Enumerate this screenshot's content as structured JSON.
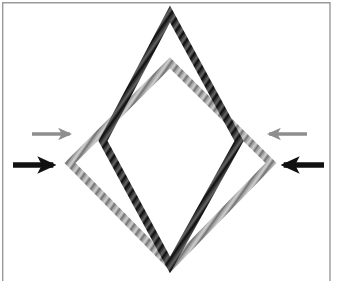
{
  "figure": {
    "background_color": "#ffffff",
    "frame": {
      "name": "panel-border",
      "color": "#9a9a9a",
      "stroke_width": 1.4,
      "x": 2,
      "y": 2,
      "width": 328,
      "height": 279,
      "open_bottom": true
    },
    "shapes": [
      {
        "id": "dark-diamond",
        "label": "undeformed-diamond",
        "color": "#3a3a3a",
        "stroke_width": 8,
        "texture": "braided-rope-hatch",
        "vertices": {
          "top": {
            "x": 170,
            "y": 14
          },
          "left": {
            "x": 103,
            "y": 141
          },
          "bottom": {
            "x": 170,
            "y": 265
          },
          "right": {
            "x": 239,
            "y": 141
          }
        },
        "width": 136,
        "height": 251
      },
      {
        "id": "gray-diamond",
        "label": "deformed-diamond",
        "color": "#a8a8a8",
        "stroke_width": 8,
        "texture": "braided-rope-hatch",
        "vertices": {
          "top": {
            "x": 170,
            "y": 63
          },
          "left": {
            "x": 70,
            "y": 163
          },
          "bottom": {
            "x": 171,
            "y": 266
          },
          "right": {
            "x": 271,
            "y": 163
          }
        },
        "width": 201,
        "height": 203
      }
    ],
    "arrows": [
      {
        "id": "arrow-left-gray",
        "label": "left-gray-arrow",
        "color": "#8e8e8e",
        "direction": "right",
        "shaft_width": 3.4,
        "head_size": 11,
        "tail": {
          "x": 32,
          "y": 134
        },
        "tip": {
          "x": 74,
          "y": 134
        }
      },
      {
        "id": "arrow-left-black",
        "label": "left-black-arrow",
        "color": "#111111",
        "direction": "right",
        "shaft_width": 5.6,
        "head_size": 15,
        "tail": {
          "x": 13,
          "y": 165
        },
        "tip": {
          "x": 59,
          "y": 165
        }
      },
      {
        "id": "arrow-right-gray",
        "label": "right-gray-arrow",
        "color": "#8e8e8e",
        "direction": "left",
        "shaft_width": 3.4,
        "head_size": 11,
        "tail": {
          "x": 307,
          "y": 134
        },
        "tip": {
          "x": 265,
          "y": 134
        }
      },
      {
        "id": "arrow-right-black",
        "label": "right-black-arrow",
        "color": "#111111",
        "direction": "left",
        "shaft_width": 5.6,
        "head_size": 15,
        "tail": {
          "x": 324,
          "y": 165
        },
        "tip": {
          "x": 278,
          "y": 165
        }
      }
    ]
  }
}
